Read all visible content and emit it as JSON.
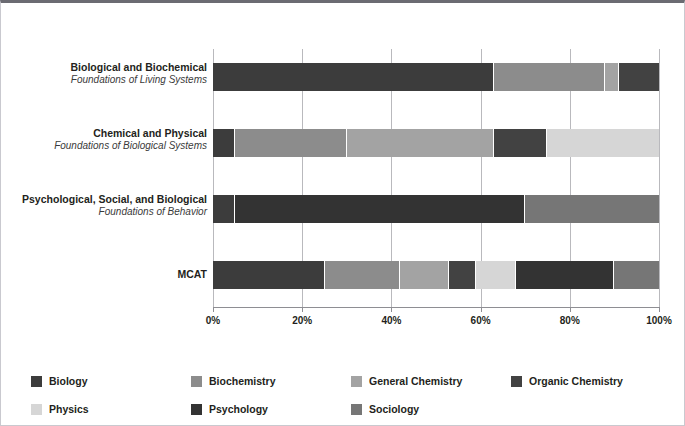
{
  "chart_data": {
    "type": "bar",
    "orientation": "horizontal",
    "stacked": true,
    "normalized": "100%",
    "title": "",
    "xlabel": "",
    "ylabel": "",
    "xlim": [
      0,
      100
    ],
    "grid": true,
    "legend_position": "bottom",
    "xticks": [
      "0%",
      "20%",
      "40%",
      "60%",
      "80%",
      "100%"
    ],
    "xtick_values": [
      0,
      20,
      40,
      60,
      80,
      100
    ],
    "categories": [
      {
        "line1": "Biological and Biochemical",
        "line2": "Foundations of Living Systems"
      },
      {
        "line1": "Chemical and Physical",
        "line2": "Foundations of Biological Systems"
      },
      {
        "line1": "Psychological, Social, and Biological",
        "line2": "Foundations of Behavior"
      },
      {
        "line1": "MCAT",
        "line2": ""
      }
    ],
    "series": [
      {
        "name": "Biology",
        "color": "#3c3c3c",
        "values": [
          63,
          5,
          5,
          25
        ]
      },
      {
        "name": "Biochemistry",
        "color": "#8c8c8c",
        "values": [
          25,
          25,
          0,
          17
        ]
      },
      {
        "name": "General Chemistry",
        "color": "#a3a3a3",
        "values": [
          3,
          33,
          0,
          11
        ]
      },
      {
        "name": "Organic Chemistry",
        "color": "#424242",
        "values": [
          9,
          12,
          0,
          6
        ]
      },
      {
        "name": "Physics",
        "color": "#d6d6d6",
        "values": [
          0,
          25,
          0,
          9
        ]
      },
      {
        "name": "Psychology",
        "color": "#333333",
        "values": [
          0,
          0,
          65,
          22
        ]
      },
      {
        "name": "Sociology",
        "color": "#767676",
        "values": [
          0,
          0,
          30,
          10
        ]
      }
    ],
    "bars": [
      {
        "category": "Biological and Biochemical",
        "segments": [
          {
            "name": "Biology",
            "value": 63,
            "color": "#3c3c3c"
          },
          {
            "name": "Biochemistry",
            "value": 25,
            "color": "#8c8c8c"
          },
          {
            "name": "General Chemistry",
            "value": 3,
            "color": "#a3a3a3"
          },
          {
            "name": "Organic Chemistry",
            "value": 9,
            "color": "#424242"
          }
        ]
      },
      {
        "category": "Chemical and Physical",
        "segments": [
          {
            "name": "Biology",
            "value": 5,
            "color": "#3c3c3c"
          },
          {
            "name": "Biochemistry",
            "value": 25,
            "color": "#8c8c8c"
          },
          {
            "name": "General Chemistry",
            "value": 33,
            "color": "#a3a3a3"
          },
          {
            "name": "Organic Chemistry",
            "value": 12,
            "color": "#424242"
          },
          {
            "name": "Physics",
            "value": 25,
            "color": "#d6d6d6"
          }
        ]
      },
      {
        "category": "Psychological, Social, and Biological",
        "segments": [
          {
            "name": "Biology",
            "value": 5,
            "color": "#3c3c3c"
          },
          {
            "name": "Psychology",
            "value": 65,
            "color": "#333333"
          },
          {
            "name": "Sociology",
            "value": 30,
            "color": "#767676"
          }
        ]
      },
      {
        "category": "MCAT",
        "segments": [
          {
            "name": "Biology",
            "value": 25,
            "color": "#3c3c3c"
          },
          {
            "name": "Biochemistry",
            "value": 17,
            "color": "#8c8c8c"
          },
          {
            "name": "General Chemistry",
            "value": 11,
            "color": "#a3a3a3"
          },
          {
            "name": "Organic Chemistry",
            "value": 6,
            "color": "#424242"
          },
          {
            "name": "Physics",
            "value": 9,
            "color": "#d6d6d6"
          },
          {
            "name": "Psychology",
            "value": 22,
            "color": "#333333"
          },
          {
            "name": "Sociology",
            "value": 10,
            "color": "#767676"
          }
        ]
      }
    ],
    "legend": [
      {
        "label": "Biology",
        "color": "#3c3c3c"
      },
      {
        "label": "Biochemistry",
        "color": "#8c8c8c"
      },
      {
        "label": "General Chemistry",
        "color": "#a3a3a3"
      },
      {
        "label": "Organic Chemistry",
        "color": "#424242"
      },
      {
        "label": "Physics",
        "color": "#d6d6d6"
      },
      {
        "label": "Psychology",
        "color": "#333333"
      },
      {
        "label": "Sociology",
        "color": "#767676"
      }
    ]
  }
}
